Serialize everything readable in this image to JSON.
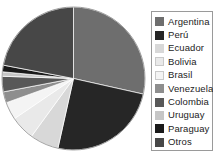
{
  "chart_data": {
    "type": "pie",
    "title": "",
    "subtitle": "",
    "xlabel": "",
    "ylabel": "",
    "legend_position": "right",
    "grid": false,
    "categories": [
      "Argentina",
      "Perú",
      "Ecuador",
      "Bolivia",
      "Brasil",
      "Venezuela",
      "Colombia",
      "Uruguay",
      "Paraguay",
      "Otros"
    ],
    "values": [
      28.5,
      25.0,
      6.5,
      5.5,
      4.0,
      2.5,
      3.5,
      1.0,
      1.5,
      22.0
    ],
    "colors": [
      "#6e6e6e",
      "#262626",
      "#d8d8d8",
      "#e9e9e9",
      "#f4f4f4",
      "#8e8e8e",
      "#585858",
      "#c6c6c6",
      "#1a1a1a",
      "#474747"
    ],
    "start_angle_deg": 0,
    "direction": "clockwise",
    "slices": [
      {
        "label": "Argentina",
        "value": 28.5,
        "color": "#6e6e6e"
      },
      {
        "label": "Perú",
        "value": 25.0,
        "color": "#262626"
      },
      {
        "label": "Ecuador",
        "value": 6.5,
        "color": "#d8d8d8"
      },
      {
        "label": "Bolivia",
        "value": 5.5,
        "color": "#e9e9e9"
      },
      {
        "label": "Brasil",
        "value": 4.0,
        "color": "#f4f4f4"
      },
      {
        "label": "Venezuela",
        "value": 2.5,
        "color": "#8e8e8e"
      },
      {
        "label": "Colombia",
        "value": 3.5,
        "color": "#585858"
      },
      {
        "label": "Uruguay",
        "value": 1.0,
        "color": "#c6c6c6"
      },
      {
        "label": "Paraguay",
        "value": 1.5,
        "color": "#1a1a1a"
      },
      {
        "label": "Otros",
        "value": 22.0,
        "color": "#474747"
      }
    ]
  },
  "legend": {
    "items": [
      {
        "label": "Argentina",
        "color": "#6e6e6e"
      },
      {
        "label": "Perú",
        "color": "#262626"
      },
      {
        "label": "Ecuador",
        "color": "#d8d8d8"
      },
      {
        "label": "Bolivia",
        "color": "#e9e9e9"
      },
      {
        "label": "Brasil",
        "color": "#f4f4f4"
      },
      {
        "label": "Venezuela",
        "color": "#8e8e8e"
      },
      {
        "label": "Colombia",
        "color": "#585858"
      },
      {
        "label": "Uruguay",
        "color": "#c6c6c6"
      },
      {
        "label": "Paraguay",
        "color": "#1a1a1a"
      },
      {
        "label": "Otros",
        "color": "#474747"
      }
    ]
  },
  "style": {
    "background": "#ffffff",
    "legend_border": "#9a9a9a",
    "text_color": "#1c1c1c"
  }
}
